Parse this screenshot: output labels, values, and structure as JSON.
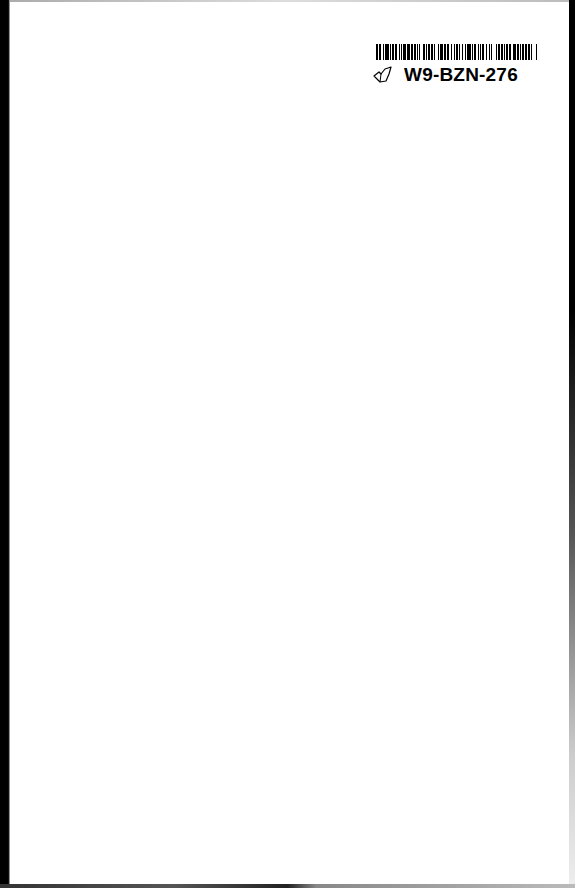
{
  "page": {
    "type": "scanned-blank-page",
    "background_color": "#ffffff",
    "edge_color": "#000000"
  },
  "library_label": {
    "barcode_id": "W9-BZN-276",
    "icon": "leaf-outline-icon",
    "barcode_bars": [
      2,
      1,
      1,
      2,
      1,
      1,
      3,
      1,
      1,
      1,
      2,
      1,
      1,
      2,
      1,
      1,
      1,
      1,
      2,
      1,
      3,
      1,
      1,
      1,
      2,
      1,
      1,
      1,
      1,
      2,
      2,
      1,
      1,
      1,
      1,
      1,
      2,
      1,
      1,
      2,
      1,
      1,
      3,
      1,
      1,
      1,
      2,
      2,
      1,
      1,
      1,
      1,
      2,
      1,
      1,
      1,
      1,
      2,
      1,
      1,
      3,
      1,
      1,
      1,
      2,
      1,
      1,
      1,
      1,
      1,
      2,
      1,
      1,
      2,
      1,
      1,
      1,
      3,
      1,
      1,
      2,
      1,
      1,
      1,
      1,
      1,
      2,
      1,
      1,
      2,
      3,
      1,
      1,
      1,
      1,
      1,
      2,
      1,
      1,
      1,
      2,
      1,
      1,
      3,
      1,
      1
    ]
  }
}
